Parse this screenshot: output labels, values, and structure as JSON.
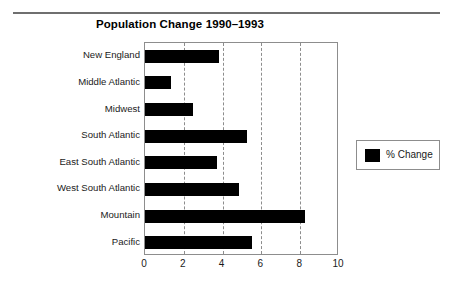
{
  "chart_data": {
    "type": "bar",
    "orientation": "horizontal",
    "title": "Population Change 1990–1993",
    "xlabel": "",
    "ylabel": "",
    "categories": [
      "New England",
      "Middle Atlantic",
      "Midwest",
      "South Atlantic",
      "East South Atlantic",
      "West South Atlantic",
      "Mountain",
      "Pacific"
    ],
    "series": [
      {
        "name": "% Change",
        "color": "#000000",
        "values": [
          3.8,
          1.35,
          2.45,
          5.25,
          3.7,
          4.85,
          8.25,
          5.5
        ]
      }
    ],
    "xlim": [
      0,
      10
    ],
    "xticks": [
      "0",
      "2",
      "4",
      "6",
      "8",
      "10"
    ],
    "xtick_values": [
      0,
      2,
      4,
      6,
      8,
      10
    ],
    "gridlines": [
      2,
      4,
      6,
      8
    ],
    "grid": true,
    "grid_style": "dashed",
    "legend": {
      "position": "right",
      "entries": [
        {
          "label": "% Change",
          "color": "#000000"
        }
      ]
    }
  },
  "colors": {
    "bar": "#000000",
    "frame": "#8d8d8d",
    "grid": "#8d8d8d",
    "rule": "#6f6f6f",
    "text": "#1a1a1a",
    "background": "#ffffff"
  }
}
